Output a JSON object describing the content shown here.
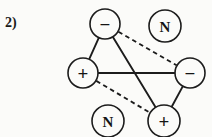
{
  "figure": {
    "item_label": "2)",
    "background_color": "#fbfbf9",
    "ink_color": "#1c1c1c",
    "width": 212,
    "height": 137
  },
  "chart_data": {
    "type": "diagram",
    "title": "",
    "subtitle": "",
    "xlabel": "",
    "ylabel": "",
    "nodes": [
      {
        "id": "top-minus",
        "label": "−",
        "kind": "sign",
        "charge": "negative",
        "cx": 105,
        "cy": 24,
        "r": 15
      },
      {
        "id": "top-right-n",
        "label": "N",
        "kind": "letter",
        "charge": "neutral",
        "cx": 165,
        "cy": 26,
        "r": 16
      },
      {
        "id": "left-plus",
        "label": "+",
        "kind": "sign",
        "charge": "positive",
        "cx": 83,
        "cy": 73,
        "r": 15
      },
      {
        "id": "right-minus",
        "label": "−",
        "kind": "sign",
        "charge": "negative",
        "cx": 190,
        "cy": 73,
        "r": 15
      },
      {
        "id": "bottom-left-n",
        "label": "N",
        "kind": "letter",
        "charge": "neutral",
        "cx": 108,
        "cy": 121,
        "r": 16
      },
      {
        "id": "bottom-plus",
        "label": "+",
        "kind": "sign",
        "charge": "positive",
        "cx": 164,
        "cy": 121,
        "r": 16
      }
    ],
    "edges": [
      {
        "id": "edge-top-minus-left-plus",
        "from": "top-minus",
        "to": "left-plus",
        "style": "solid"
      },
      {
        "id": "edge-top-minus-bottom-plus",
        "from": "top-minus",
        "to": "bottom-plus",
        "style": "solid"
      },
      {
        "id": "edge-left-plus-right-minus",
        "from": "left-plus",
        "to": "right-minus",
        "style": "solid"
      },
      {
        "id": "edge-right-minus-bottom-plus",
        "from": "right-minus",
        "to": "bottom-plus",
        "style": "solid"
      },
      {
        "id": "edge-top-minus-right-minus",
        "from": "top-minus",
        "to": "right-minus",
        "style": "dashed"
      },
      {
        "id": "edge-left-plus-bottom-plus",
        "from": "left-plus",
        "to": "bottom-plus",
        "style": "dashed"
      }
    ],
    "legend": {
      "solid": "attraction",
      "dashed": "repulsion"
    }
  }
}
